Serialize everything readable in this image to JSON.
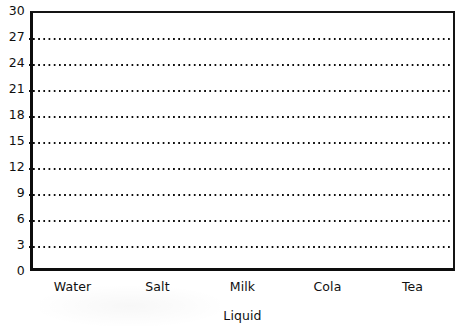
{
  "chart_data": {
    "type": "bar",
    "title": "",
    "subtitle": "",
    "xlabel": "Liquid",
    "ylabel": "",
    "categories": [
      "Water",
      "Salt",
      "Milk",
      "Cola",
      "Tea"
    ],
    "values": [
      null,
      null,
      null,
      null,
      null
    ],
    "series": [],
    "ylim": [
      0,
      30
    ],
    "y_tick_step": 3,
    "y_ticks": [
      0,
      3,
      6,
      9,
      12,
      15,
      18,
      21,
      24,
      27,
      30
    ],
    "y_tick_labels": [
      "0",
      "3",
      "6",
      "9",
      "12",
      "15",
      "18",
      "21",
      "24",
      "27",
      "30"
    ],
    "grid": true,
    "grid_style": "dotted",
    "grid_axis": "y",
    "legend": false,
    "legend_position": "none",
    "annotations": [],
    "note": "Empty grid template - no data series plotted in the plot area"
  },
  "colors": {
    "axis": "#0d0d0d",
    "grid": "#0d0d0d",
    "text": "#101010",
    "background": "#ffffff"
  },
  "axis_title": "Liquid"
}
